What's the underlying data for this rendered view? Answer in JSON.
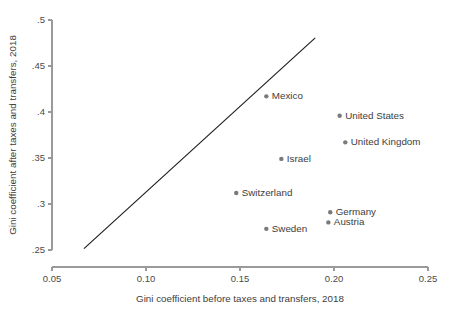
{
  "chart_data": {
    "type": "scatter",
    "title": "",
    "xlabel": "Gini coefficient before taxes and transfers, 2018",
    "ylabel": "Gini coefficient after taxes and transfers, 2018",
    "xlim": [
      0.05,
      0.25
    ],
    "ylim": [
      0.25,
      0.5
    ],
    "xticks": [
      "0.05",
      "0.10",
      "0.15",
      "0.20",
      "0.25"
    ],
    "xtick_values": [
      0.05,
      0.1,
      0.15,
      0.2,
      0.25
    ],
    "yticks": [
      ".25",
      ".3",
      ".35",
      ".4",
      ".45",
      ".5"
    ],
    "ytick_values": [
      0.25,
      0.3,
      0.35,
      0.4,
      0.45,
      0.5
    ],
    "grid": false,
    "legend": "none",
    "reference_line": {
      "name": "45-degree-line",
      "description": "diagonal equality line",
      "x_start": 0.067,
      "y_start": 0.2515,
      "x_end": 0.19,
      "y_end": 0.4805,
      "color": "#1c1c1c"
    },
    "point_color": "#7a7a7a",
    "points": [
      {
        "name": "Mexico",
        "x": 0.164,
        "y": 0.417,
        "label_side": "right"
      },
      {
        "name": "United States",
        "x": 0.203,
        "y": 0.396,
        "label_side": "right"
      },
      {
        "name": "United Kingdom",
        "x": 0.206,
        "y": 0.367,
        "label_side": "right"
      },
      {
        "name": "Israel",
        "x": 0.172,
        "y": 0.349,
        "label_side": "right"
      },
      {
        "name": "Switzerland",
        "x": 0.148,
        "y": 0.312,
        "label_side": "right"
      },
      {
        "name": "Germany",
        "x": 0.198,
        "y": 0.291,
        "label_side": "right"
      },
      {
        "name": "Austria",
        "x": 0.197,
        "y": 0.28,
        "label_side": "right"
      },
      {
        "name": "Sweden",
        "x": 0.164,
        "y": 0.273,
        "label_side": "right"
      }
    ]
  }
}
